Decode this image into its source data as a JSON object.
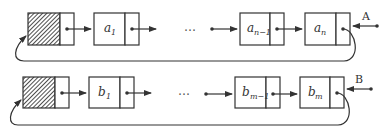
{
  "diagram": {
    "type": "circular-singly-linked-lists-with-tail-pointers",
    "list_a": {
      "tail_pointer_label": "A",
      "nodes": [
        {
          "name": "head",
          "base": "",
          "sub": ""
        },
        {
          "name": "a1",
          "base": "a",
          "sub": "1"
        },
        {
          "name": "ellipsis",
          "base": "…",
          "sub": ""
        },
        {
          "name": "a_n-1",
          "base": "a",
          "sub": "n−1"
        },
        {
          "name": "a_n",
          "base": "a",
          "sub": "n"
        }
      ]
    },
    "list_b": {
      "tail_pointer_label": "B",
      "nodes": [
        {
          "name": "head",
          "base": "",
          "sub": ""
        },
        {
          "name": "b1",
          "base": "b",
          "sub": "1"
        },
        {
          "name": "ellipsis",
          "base": "…",
          "sub": ""
        },
        {
          "name": "b_m-1",
          "base": "b",
          "sub": "m−1"
        },
        {
          "name": "b_m",
          "base": "b",
          "sub": "m"
        }
      ]
    },
    "colors": {
      "stroke": "#333333",
      "background": "#ffffff"
    }
  }
}
